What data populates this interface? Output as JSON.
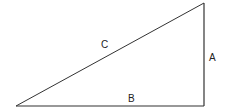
{
  "diagram": {
    "type": "right-triangle",
    "stroke_color": "#333333",
    "background": "#ffffff",
    "vertices": {
      "bottom_left": [
        16,
        106
      ],
      "right_angle": [
        204,
        106
      ],
      "top": [
        204,
        3
      ]
    },
    "sides": [
      {
        "label": "A",
        "role": "vertical-leg",
        "position": [
          210,
          61
        ]
      },
      {
        "label": "B",
        "role": "horizontal-leg",
        "position": [
          128,
          102
        ]
      },
      {
        "label": "C",
        "role": "hypotenuse",
        "position": [
          101,
          48
        ]
      }
    ]
  }
}
